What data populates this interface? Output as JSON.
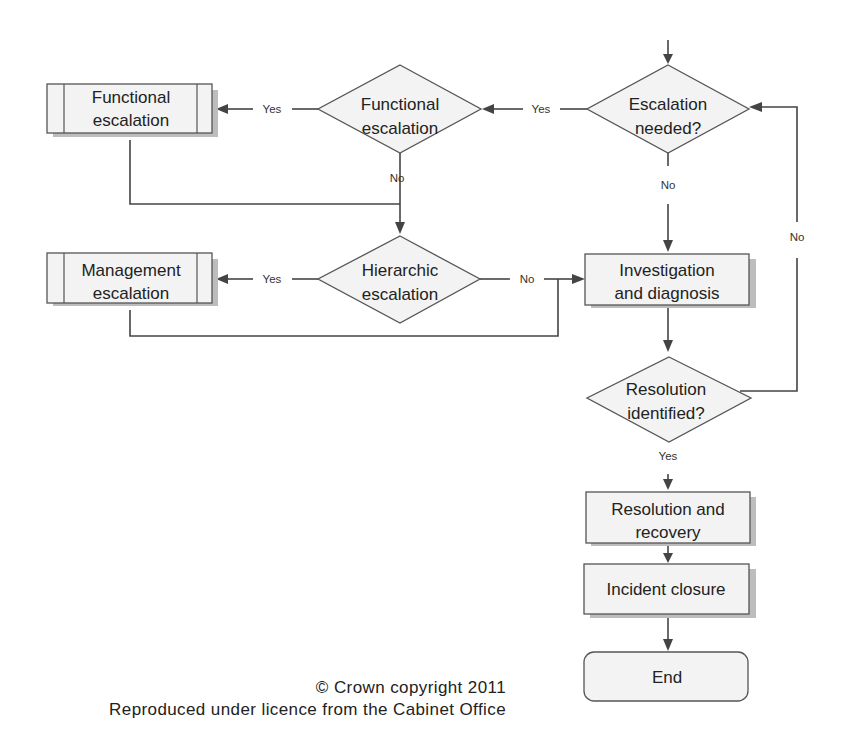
{
  "diagram": {
    "colors": {
      "shape_fill": "#f3f3f3",
      "shape_stroke": "#555555",
      "line": "#444444",
      "text": "#222222",
      "shadow": "#bdbdbd"
    },
    "nodes": {
      "escalation_needed": {
        "type": "decision",
        "lines": [
          "Escalation",
          "needed?"
        ]
      },
      "functional_decision": {
        "type": "decision",
        "lines": [
          "Functional",
          "escalation"
        ]
      },
      "functional_process": {
        "type": "predefined-process",
        "lines": [
          "Functional",
          "escalation"
        ]
      },
      "hierarchic_decision": {
        "type": "decision",
        "lines": [
          "Hierarchic",
          "escalation"
        ]
      },
      "management_process": {
        "type": "predefined-process",
        "lines": [
          "Management",
          "escalation"
        ]
      },
      "investigation": {
        "type": "process",
        "lines": [
          "Investigation",
          "and diagnosis"
        ]
      },
      "resolution_identified": {
        "type": "decision",
        "lines": [
          "Resolution",
          "identified?"
        ]
      },
      "resolution_recovery": {
        "type": "process",
        "lines": [
          "Resolution and",
          "recovery"
        ]
      },
      "incident_closure": {
        "type": "process",
        "lines": [
          "Incident closure"
        ]
      },
      "end": {
        "type": "terminator",
        "lines": [
          "End"
        ]
      }
    },
    "edges": [
      {
        "from": "entry",
        "to": "escalation_needed",
        "label": ""
      },
      {
        "from": "escalation_needed",
        "to": "functional_decision",
        "label": "Yes"
      },
      {
        "from": "escalation_needed",
        "to": "investigation",
        "label": "No"
      },
      {
        "from": "functional_decision",
        "to": "functional_process",
        "label": "Yes"
      },
      {
        "from": "functional_decision",
        "to": "hierarchic_decision",
        "label": "No"
      },
      {
        "from": "functional_process",
        "to": "hierarchic_decision",
        "label": ""
      },
      {
        "from": "hierarchic_decision",
        "to": "management_process",
        "label": "Yes"
      },
      {
        "from": "hierarchic_decision",
        "to": "investigation",
        "label": "No"
      },
      {
        "from": "management_process",
        "to": "investigation",
        "label": ""
      },
      {
        "from": "investigation",
        "to": "resolution_identified",
        "label": ""
      },
      {
        "from": "resolution_identified",
        "to": "escalation_needed",
        "label": "No"
      },
      {
        "from": "resolution_identified",
        "to": "resolution_recovery",
        "label": "Yes"
      },
      {
        "from": "resolution_recovery",
        "to": "incident_closure",
        "label": ""
      },
      {
        "from": "incident_closure",
        "to": "end",
        "label": ""
      }
    ],
    "labels": {
      "yes": "Yes",
      "no": "No"
    }
  },
  "credits": {
    "line1": "© Crown copyright 2011",
    "line2": "Reproduced under licence from the Cabinet Office"
  }
}
